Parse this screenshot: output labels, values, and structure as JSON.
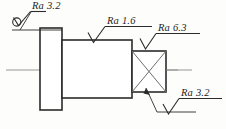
{
  "drawing": {
    "title": "Stepped shaft with square end — surface roughness annotation",
    "background_color": "#fdfdfb",
    "line_color": "#2b2b2b",
    "centerline_color": "#8a8a8a",
    "diagonal_color": "#6e6e6e"
  },
  "annotations": [
    {
      "id": "ra-top-left",
      "label": "Ra 3.2",
      "value": "3.2",
      "parameter": "Ra",
      "symbol": "surface-finish-basic-with-circle",
      "position": "top-left",
      "applies_to": "left-flange-outer-face"
    },
    {
      "id": "ra-top-middle",
      "label": "Ra 1.6",
      "value": "1.6",
      "parameter": "Ra",
      "symbol": "surface-finish-basic",
      "position": "top-middle",
      "applies_to": "middle-shaft-cylindrical-surface"
    },
    {
      "id": "ra-top-right",
      "label": "Ra 6.3",
      "value": "6.3",
      "parameter": "Ra",
      "symbol": "surface-finish-basic",
      "position": "top-right",
      "applies_to": "square-section-top-face"
    },
    {
      "id": "ra-bottom-right",
      "label": "Ra 3.2",
      "value": "3.2",
      "parameter": "Ra",
      "symbol": "surface-finish-basic",
      "position": "bottom-right",
      "applies_to": "square-section-side-face"
    }
  ],
  "features": [
    {
      "id": "left-flange",
      "name": "Left flange",
      "shape": "rectangle"
    },
    {
      "id": "middle-shaft",
      "name": "Middle shaft",
      "shape": "rectangle"
    },
    {
      "id": "square-section",
      "name": "Square section",
      "shape": "rectangle-with-diagonals"
    },
    {
      "id": "axis",
      "name": "Centre axis",
      "shape": "centerline"
    }
  ]
}
